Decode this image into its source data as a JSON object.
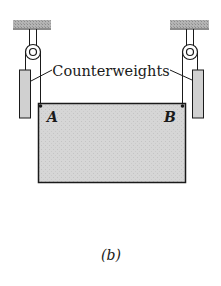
{
  "figure": {
    "label": "(b)",
    "labels": {
      "counterweights": "Counterweights",
      "point_a": "A",
      "point_b": "B"
    },
    "colors": {
      "plate_fill": "#d6d6d6",
      "ceiling_fill": "#a8a8a8",
      "weight_fill": "#d0d0d0",
      "stroke": "#1a1a1a"
    }
  }
}
